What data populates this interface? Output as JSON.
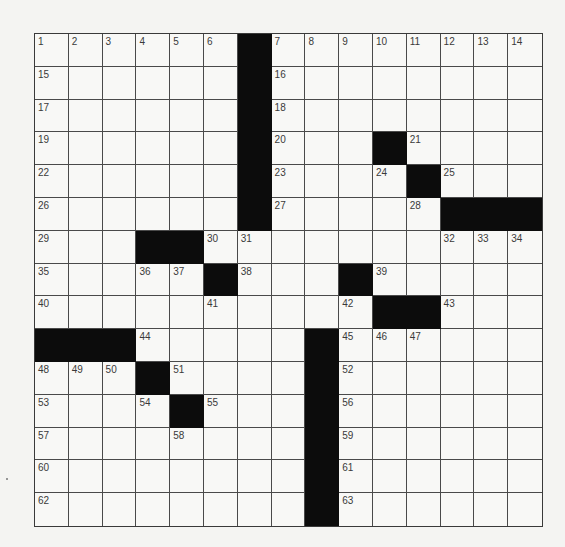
{
  "puzzle": {
    "rows": 15,
    "cols": 15,
    "colors": {
      "block": "#0c0c0c",
      "cell": "#f8f8f6",
      "grid_line": "#4a4a4a",
      "number": "#3a3a3a",
      "page": "#f4f4f2"
    },
    "layout": [
      [
        "1",
        "2",
        "3",
        "4",
        "5",
        "6",
        "#",
        "7",
        "8",
        "9",
        "10",
        "11",
        "12",
        "13",
        "14"
      ],
      [
        "15",
        "",
        "",
        "",
        "",
        "",
        "#",
        "16",
        "",
        "",
        "",
        "",
        "",
        "",
        ""
      ],
      [
        "17",
        "",
        "",
        "",
        "",
        "",
        "#",
        "18",
        "",
        "",
        "",
        "",
        "",
        "",
        ""
      ],
      [
        "19",
        "",
        "",
        "",
        "",
        "",
        "#",
        "20",
        "",
        "",
        "#",
        "21",
        "",
        "",
        ""
      ],
      [
        "22",
        "",
        "",
        "",
        "",
        "",
        "#",
        "23",
        "",
        "",
        "24",
        "#",
        "25",
        "",
        ""
      ],
      [
        "26",
        "",
        "",
        "",
        "",
        "",
        "#",
        "27",
        "",
        "",
        "",
        "28",
        "#",
        "#",
        "#"
      ],
      [
        "29",
        "",
        "",
        "#",
        "#",
        "30",
        "31",
        "",
        "",
        "",
        "",
        "",
        "32",
        "33",
        "34"
      ],
      [
        "35",
        "",
        "",
        "36",
        "37",
        "#",
        "38",
        "",
        "",
        "#",
        "39",
        "",
        "",
        "",
        ""
      ],
      [
        "40",
        "",
        "",
        "",
        "",
        "41",
        "",
        "",
        "",
        "42",
        "#",
        "#",
        "43",
        "",
        ""
      ],
      [
        "#",
        "#",
        "#",
        "44",
        "",
        "",
        "",
        "",
        "#",
        "45",
        "46",
        "47",
        "",
        "",
        ""
      ],
      [
        "48",
        "49",
        "50",
        "#",
        "51",
        "",
        "",
        "",
        "#",
        "52",
        "",
        "",
        "",
        "",
        ""
      ],
      [
        "53",
        "",
        "",
        "54",
        "#",
        "55",
        "",
        "",
        "#",
        "56",
        "",
        "",
        "",
        "",
        ""
      ],
      [
        "57",
        "",
        "",
        "",
        "58",
        "",
        "",
        "",
        "#",
        "59",
        "",
        "",
        "",
        "",
        ""
      ],
      [
        "60",
        "",
        "",
        "",
        "",
        "",
        "",
        "",
        "#",
        "61",
        "",
        "",
        "",
        "",
        ""
      ],
      [
        "62",
        "",
        "",
        "",
        "",
        "",
        "",
        "",
        "#",
        "63",
        "",
        "",
        "",
        "",
        ""
      ]
    ]
  }
}
